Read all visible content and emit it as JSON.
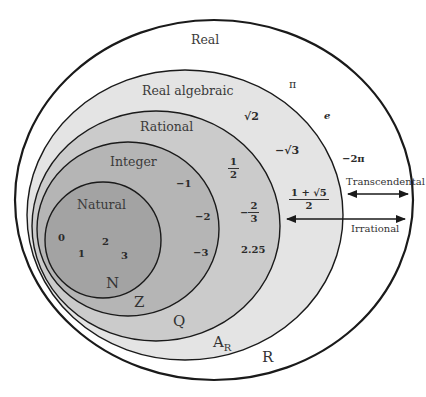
{
  "colors": {
    "real": "#ffffff",
    "real_algebraic": "#e4e4e4",
    "rational": "#cbcbcb",
    "integer": "#b5b5b5",
    "natural": "#a3a3a3",
    "stroke": "#1a1a1a"
  },
  "sets": {
    "real": {
      "name": "Real",
      "symbol": "R"
    },
    "real_algebraic": {
      "name": "Real algebraic",
      "symbol": "A",
      "symbol_sub": "R"
    },
    "rational": {
      "name": "Rational",
      "symbol": "Q"
    },
    "integer": {
      "name": "Integer",
      "symbol": "Z"
    },
    "natural": {
      "name": "Natural",
      "symbol": "N"
    }
  },
  "elements": {
    "natural": [
      "0",
      "1",
      "2",
      "3"
    ],
    "integer": [
      "−1",
      "−2",
      "−3"
    ],
    "rational": {
      "half": {
        "num": "1",
        "den": "2"
      },
      "neg_two_thirds": {
        "sign": "−",
        "num": "2",
        "den": "3"
      },
      "decimal": "2.25"
    },
    "real_algebraic": {
      "sqrt2": "√2",
      "neg_sqrt3": "−√3",
      "golden": {
        "num": "1 + √5",
        "den": "2"
      }
    },
    "real": {
      "pi": "π",
      "e": "e",
      "neg_two_pi": "−2π"
    }
  },
  "annotations": {
    "transcendental": "Transcendental",
    "irrational": "Irrational"
  }
}
